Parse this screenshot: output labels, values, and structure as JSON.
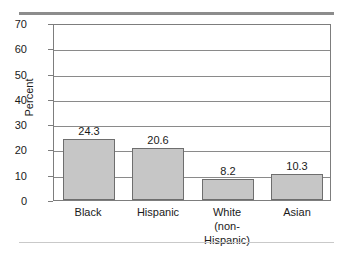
{
  "chart_data": {
    "type": "bar",
    "title": "",
    "xlabel": "",
    "ylabel": "Percent",
    "ylim": [
      0,
      70
    ],
    "ytick_labels": [
      "70",
      "60",
      "50",
      "40",
      "30",
      "20",
      "10",
      "0"
    ],
    "yticks": [
      70,
      60,
      50,
      40,
      30,
      20,
      10,
      0
    ],
    "grid": true,
    "legend": "none",
    "categories": [
      "Black",
      "Hispanic",
      "White",
      "Asian"
    ],
    "category_sublabels": [
      "",
      "",
      "(non-Hispanic)",
      ""
    ],
    "values": [
      24.3,
      20.6,
      8.2,
      10.3
    ],
    "value_labels": [
      "24.3",
      "20.6",
      "8.2",
      "10.3"
    ],
    "colors": {
      "bar_fill": "#c6c6c6",
      "bar_border": "#6e6e6e",
      "gridline": "#8a8a8a",
      "frame": "#7d7d7d",
      "text": "#1a1a1a",
      "top_rule": "#8c8c8c",
      "bottom_rule": "#c9c9c9"
    }
  }
}
